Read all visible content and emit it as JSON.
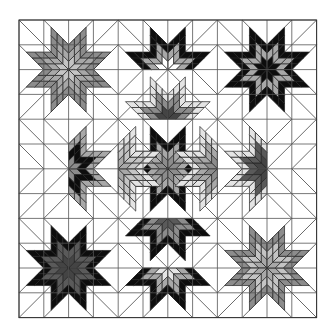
{
  "diagram": {
    "title": "Lone Star quilt layout",
    "type": "quilt-pattern",
    "origin": [
      19,
      20
    ],
    "cell_size": 24.8,
    "grid_cells": 12,
    "background": "#ffffff",
    "colors": {
      "white": "#ffffff",
      "verylight": "#e4e4e4",
      "light": "#c4c4c4",
      "mid": "#a8a8a8",
      "gray": "#8c8c8c",
      "dark": "#5a5a5a",
      "darker": "#444444",
      "black": "#0d0d0d"
    },
    "full_stars": [
      {
        "name": "star-top-left",
        "block": [
          0,
          0
        ],
        "rings": [
          "light",
          "mid",
          "gray"
        ]
      },
      {
        "name": "star-top-right",
        "block": [
          2,
          0
        ],
        "rings": [
          "black",
          "mid",
          "black"
        ]
      },
      {
        "name": "star-center",
        "block": [
          1,
          1
        ],
        "rings": [
          "gray",
          "mid",
          "black"
        ]
      },
      {
        "name": "star-bottom-left",
        "block": [
          0,
          2
        ],
        "rings": [
          "darker",
          "dark",
          "black"
        ]
      },
      {
        "name": "star-bottom-right",
        "block": [
          2,
          2
        ],
        "rings": [
          "mid",
          "light",
          "gray"
        ]
      }
    ],
    "half_stars": [
      {
        "name": "half-star-top-upper",
        "center_cell": [
          6,
          2
        ],
        "direction": "up",
        "rings": [
          "white",
          "mid",
          "black"
        ]
      },
      {
        "name": "half-star-top-lower",
        "center_cell": [
          6,
          4
        ],
        "direction": "up",
        "rings": [
          "darker",
          "gray",
          "verylight"
        ]
      },
      {
        "name": "half-star-left-outer",
        "center_cell": [
          2,
          6
        ],
        "direction": "right",
        "rings": [
          "gray",
          "black",
          "mid"
        ]
      },
      {
        "name": "half-star-left-inner",
        "center_cell": [
          4,
          6
        ],
        "direction": "right",
        "rings": [
          "mid",
          "light",
          "verylight"
        ]
      },
      {
        "name": "half-star-right-inner",
        "center_cell": [
          8,
          6
        ],
        "direction": "left",
        "rings": [
          "gray",
          "mid",
          "verylight"
        ]
      },
      {
        "name": "half-star-right-outer",
        "center_cell": [
          10,
          6
        ],
        "direction": "left",
        "rings": [
          "darker",
          "dark",
          "verylight"
        ]
      },
      {
        "name": "half-star-bottom-upper",
        "center_cell": [
          6,
          8
        ],
        "direction": "down",
        "rings": [
          "dark",
          "gray",
          "black"
        ]
      },
      {
        "name": "half-star-bottom-lower",
        "center_cell": [
          6,
          10
        ],
        "direction": "down",
        "rings": [
          "verylight",
          "mid",
          "black"
        ]
      }
    ]
  }
}
